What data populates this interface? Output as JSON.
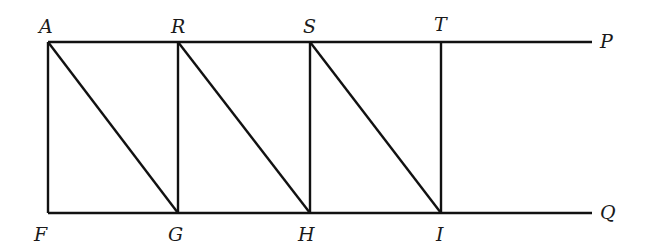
{
  "diagram": {
    "type": "geometric-figure",
    "labels": {
      "A": "A",
      "R": "R",
      "S": "S",
      "T": "T",
      "P": "P",
      "F": "F",
      "G": "G",
      "H": "H",
      "I": "I",
      "Q": "Q"
    },
    "points": {
      "A": [
        48,
        42
      ],
      "R": [
        178,
        42
      ],
      "S": [
        310,
        42
      ],
      "T": [
        441,
        42
      ],
      "P": [
        592,
        42
      ],
      "F": [
        48,
        213
      ],
      "G": [
        178,
        213
      ],
      "H": [
        310,
        213
      ],
      "I": [
        441,
        213
      ],
      "Q": [
        592,
        213
      ]
    },
    "segments": [
      [
        "A",
        "P"
      ],
      [
        "F",
        "Q"
      ],
      [
        "A",
        "F"
      ],
      [
        "R",
        "G"
      ],
      [
        "S",
        "H"
      ],
      [
        "T",
        "I"
      ],
      [
        "A",
        "G"
      ],
      [
        "R",
        "H"
      ],
      [
        "S",
        "I"
      ]
    ],
    "stroke_color": "#111111"
  }
}
